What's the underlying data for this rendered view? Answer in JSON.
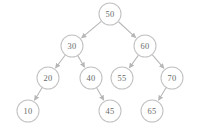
{
  "diagram": {
    "background_color": "#ffffff",
    "node_fill_color": "#ffffff",
    "node_stroke_color": "#c2c2c2",
    "edge_color": "#b6b6b6",
    "label_color": "#6a6a6a",
    "node_radius": 11,
    "nodes": [
      {
        "id": "n50",
        "label": "50",
        "cx": 110,
        "cy": 14
      },
      {
        "id": "n30",
        "label": "30",
        "cx": 72,
        "cy": 46
      },
      {
        "id": "n60",
        "label": "60",
        "cx": 145,
        "cy": 46
      },
      {
        "id": "n20",
        "label": "20",
        "cx": 48,
        "cy": 78
      },
      {
        "id": "n40",
        "label": "40",
        "cx": 91,
        "cy": 78
      },
      {
        "id": "n55",
        "label": "55",
        "cx": 122,
        "cy": 78
      },
      {
        "id": "n70",
        "label": "70",
        "cx": 172,
        "cy": 78
      },
      {
        "id": "n10",
        "label": "10",
        "cx": 28,
        "cy": 111
      },
      {
        "id": "n45",
        "label": "45",
        "cx": 110,
        "cy": 111
      },
      {
        "id": "n65",
        "label": "65",
        "cx": 152,
        "cy": 111
      }
    ],
    "edges": [
      {
        "id": "e50-30",
        "from": "n50",
        "to": "n30",
        "side": "left",
        "from_label": "50",
        "to_label": "30"
      },
      {
        "id": "e50-60",
        "from": "n50",
        "to": "n60",
        "side": "right",
        "from_label": "50",
        "to_label": "60"
      },
      {
        "id": "e30-20",
        "from": "n30",
        "to": "n20",
        "side": "left",
        "from_label": "30",
        "to_label": "20"
      },
      {
        "id": "e30-40",
        "from": "n30",
        "to": "n40",
        "side": "right",
        "from_label": "30",
        "to_label": "40"
      },
      {
        "id": "e60-55",
        "from": "n60",
        "to": "n55",
        "side": "left",
        "from_label": "60",
        "to_label": "55"
      },
      {
        "id": "e60-70",
        "from": "n60",
        "to": "n70",
        "side": "right",
        "from_label": "60",
        "to_label": "70"
      },
      {
        "id": "e20-10",
        "from": "n20",
        "to": "n10",
        "side": "left",
        "from_label": "20",
        "to_label": "10"
      },
      {
        "id": "e40-45",
        "from": "n40",
        "to": "n45",
        "side": "right",
        "from_label": "40",
        "to_label": "45"
      },
      {
        "id": "e70-65",
        "from": "n70",
        "to": "n65",
        "side": "left",
        "from_label": "70",
        "to_label": "65"
      }
    ]
  }
}
